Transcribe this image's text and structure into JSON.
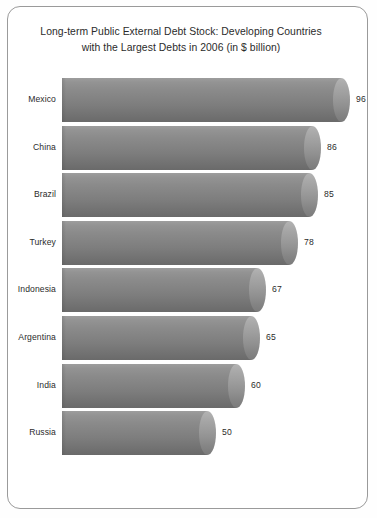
{
  "chart_data": {
    "type": "bar",
    "orientation": "horizontal",
    "title": "Long-term Public External Debt Stock: Developing Countries\nwith the Largest Debts in 2006 (in $ billion)",
    "title_line1": "Long-term Public External Debt Stock: Developing Countries",
    "title_line2": "with the Largest Debts in 2006 (in $ billion)",
    "xlabel": "",
    "ylabel": "",
    "unit": "$ billion",
    "year": "2006",
    "grid": false,
    "legend": "none",
    "xlim": [
      0,
      96
    ],
    "categories": [
      "Mexico",
      "China",
      "Brazil",
      "Turkey",
      "Indonesia",
      "Argentina",
      "India",
      "Russia"
    ],
    "values": [
      96,
      86,
      85,
      78,
      67,
      65,
      60,
      50
    ],
    "value_labels": [
      "96",
      "86",
      "85",
      "78",
      "67",
      "65",
      "60",
      "50"
    ],
    "series": [
      {
        "name": "Long-term public external debt stock",
        "values": [
          96,
          86,
          85,
          78,
          67,
          65,
          60,
          50
        ]
      }
    ],
    "points": [
      {
        "category": "Mexico",
        "value": 96,
        "label": "96"
      },
      {
        "category": "China",
        "value": 86,
        "label": "86"
      },
      {
        "category": "Brazil",
        "value": 85,
        "label": "85"
      },
      {
        "category": "Turkey",
        "value": 78,
        "label": "78"
      },
      {
        "category": "Indonesia",
        "value": 67,
        "label": "67"
      },
      {
        "category": "Argentina",
        "value": 65,
        "label": "65"
      },
      {
        "category": "India",
        "value": 60,
        "label": "60"
      },
      {
        "category": "Russia",
        "value": 50,
        "label": "50"
      }
    ],
    "colors": {
      "bar_light": "#9d9d9d",
      "bar_dark": "#6a6a6a",
      "cap_light": "#b3b3b3",
      "cap_dark": "#7b7b7b",
      "text": "#2b2b2b",
      "frame": "#9a9a9a",
      "background": "#ffffff"
    }
  }
}
